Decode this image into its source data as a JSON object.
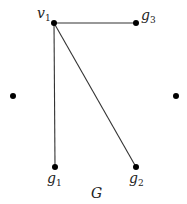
{
  "figure": {
    "caption": "G",
    "nodes": [
      {
        "id": "v1",
        "label": "v",
        "sub": "1",
        "x": 54,
        "y": 23,
        "lx": 38,
        "ly": 18
      },
      {
        "id": "g3",
        "label": "g",
        "sub": "3",
        "x": 136,
        "y": 23,
        "lx": 142,
        "ly": 18
      },
      {
        "id": "left",
        "label": "",
        "sub": "",
        "x": 13,
        "y": 96
      },
      {
        "id": "right",
        "label": "",
        "sub": "",
        "x": 176,
        "y": 96
      },
      {
        "id": "g1",
        "label": "g",
        "sub": "1",
        "x": 55,
        "y": 167,
        "lx": 47,
        "ly": 184
      },
      {
        "id": "g2",
        "label": "g",
        "sub": "2",
        "x": 136,
        "y": 167,
        "lx": 129,
        "ly": 184
      }
    ],
    "edges": [
      {
        "from": "v1",
        "to": "g3"
      },
      {
        "from": "v1",
        "to": "g1"
      },
      {
        "from": "v1",
        "to": "g2"
      }
    ]
  }
}
